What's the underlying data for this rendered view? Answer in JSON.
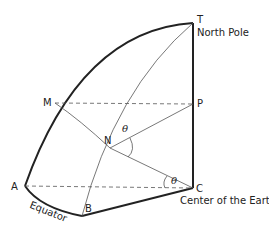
{
  "diagram": {
    "points": {
      "T": {
        "label": "T",
        "note": "North Pole"
      },
      "P": {
        "label": "P"
      },
      "M": {
        "label": "M"
      },
      "N": {
        "label": "N"
      },
      "A": {
        "label": "A"
      },
      "B": {
        "label": "B"
      },
      "C": {
        "label": "C",
        "note": "Center of the Earth"
      }
    },
    "angle_label": "θ",
    "arc_label": "Equator",
    "colors": {
      "line": "#222222",
      "thin": "#555555"
    }
  }
}
